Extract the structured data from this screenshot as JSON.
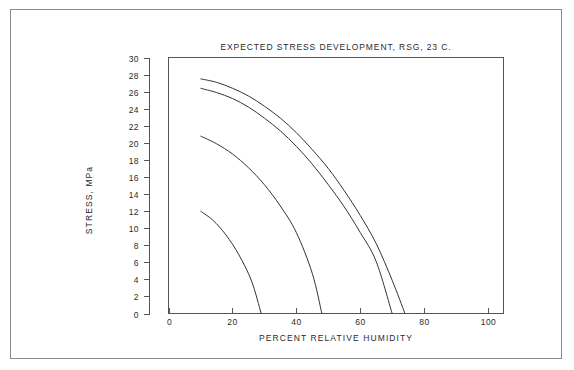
{
  "figure": {
    "name": "expected-stress-development-plot",
    "background_color": "#ffffff",
    "frame_color": "#8a8a8a",
    "axis_color": "#555555",
    "curve_color": "#333333"
  },
  "chart_data": {
    "type": "line",
    "title": "EXPECTED STRESS DEVELOPMENT, RSG, 23 C.",
    "xlabel": "PERCENT RELATIVE HUMIDITY",
    "ylabel": "STRESS, MPa",
    "xlim": [
      0,
      106
    ],
    "ylim": [
      0,
      30
    ],
    "xticks": [
      0,
      20,
      40,
      60,
      80,
      100
    ],
    "xtick_labels": [
      "0",
      "20",
      "40",
      "60",
      "80",
      "100"
    ],
    "yticks": [
      0,
      2,
      4,
      6,
      8,
      10,
      12,
      14,
      16,
      18,
      20,
      22,
      24,
      26,
      28,
      30
    ],
    "ytick_labels": [
      "0",
      "2",
      "4",
      "6",
      "8",
      "10",
      "12",
      "14",
      "16",
      "18",
      "20",
      "22",
      "24",
      "26",
      "28",
      "30"
    ],
    "grid": false,
    "legend": false,
    "legend_position": "none",
    "series": [
      {
        "name": "curve-1",
        "x": [
          10,
          15,
          20,
          25,
          30,
          35,
          40,
          45,
          50,
          55,
          60,
          65,
          70,
          74
        ],
        "y": [
          27.5,
          27.1,
          26.4,
          25.5,
          24.3,
          22.9,
          21.2,
          19.2,
          17.0,
          14.4,
          11.5,
          8.2,
          3.9,
          0.0
        ]
      },
      {
        "name": "curve-2",
        "x": [
          10,
          15,
          20,
          25,
          30,
          35,
          40,
          45,
          50,
          55,
          60,
          65,
          70
        ],
        "y": [
          26.4,
          25.9,
          25.2,
          24.2,
          22.9,
          21.4,
          19.6,
          17.5,
          15.1,
          12.5,
          9.5,
          6.1,
          0.0
        ]
      },
      {
        "name": "curve-3",
        "x": [
          10,
          15,
          20,
          25,
          30,
          35,
          40,
          45,
          48
        ],
        "y": [
          20.8,
          19.9,
          18.7,
          17.1,
          15.1,
          12.6,
          9.5,
          4.7,
          0.0
        ]
      },
      {
        "name": "curve-4",
        "x": [
          10,
          14,
          18,
          22,
          26,
          29
        ],
        "y": [
          12.0,
          10.9,
          9.2,
          6.9,
          3.8,
          0.0
        ]
      }
    ]
  }
}
